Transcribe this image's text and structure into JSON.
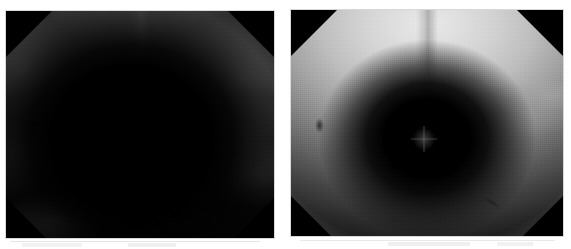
{
  "figure": {
    "kind": "image-pair",
    "background_color": "#ffffff",
    "width": 571,
    "height": 249,
    "caption": "",
    "panels": [
      {
        "id": "left",
        "label": "",
        "modality": "endoscopic-grayscale",
        "exposure": "dark",
        "description": "Dark grayscale endoscopic view with octagonal vignette, black corner triangles and a large unlit central void.",
        "frame_color": "#d8d8d8",
        "corner_color": "#000000",
        "geometry": {
          "x": 6,
          "y": 11,
          "width": 268,
          "height": 227
        },
        "features": [
          {
            "name": "central-void",
            "kind": "dark-region",
            "center_pct": [
              47,
              56
            ]
          },
          {
            "name": "upper-right-sheen",
            "kind": "highlight",
            "center_pct": [
              88,
              30
            ]
          },
          {
            "name": "upper-left-sheen",
            "kind": "highlight",
            "center_pct": [
              7,
              26
            ]
          },
          {
            "name": "lower-left-halo",
            "kind": "highlight",
            "center_pct": [
              18,
              92
            ]
          },
          {
            "name": "dark-spot",
            "kind": "lesion-spot",
            "center_pct": [
              9,
              48
            ]
          },
          {
            "name": "vertical-seam",
            "kind": "ridge",
            "center_pct": [
              50,
              12
            ]
          }
        ]
      },
      {
        "id": "right",
        "label": "",
        "modality": "endoscopic-grayscale",
        "exposure": "bright",
        "description": "Brighter grayscale endoscopic view of the same scene; light mucosal wall with a deep dark lumen at the centre and a specular starburst at its core.",
        "frame_color": "#d8d8d8",
        "corner_color": "#000000",
        "geometry": {
          "x": 291,
          "y": 10,
          "width": 272,
          "height": 226
        },
        "features": [
          {
            "name": "central-lumen",
            "kind": "dark-region",
            "center_pct": [
              50,
              57
            ]
          },
          {
            "name": "specular-starburst",
            "kind": "specular-highlight",
            "center_pct": [
              49,
              57
            ]
          },
          {
            "name": "right-tissue-band",
            "kind": "highlight",
            "center_pct": [
              84,
              44
            ]
          },
          {
            "name": "dark-spot",
            "kind": "lesion-spot",
            "center_pct": [
              9,
              48
            ]
          },
          {
            "name": "lower-streak",
            "kind": "fold",
            "center_pct": [
              70,
              84
            ]
          },
          {
            "name": "vertical-seam",
            "kind": "ridge",
            "center_pct": [
              50,
              10
            ]
          }
        ]
      }
    ],
    "artifacts": {
      "description": "Faint light-gray scanner marks along the lower edge of the page.",
      "color": "#eeeeee"
    }
  }
}
